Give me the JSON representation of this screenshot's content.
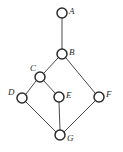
{
  "diagram": {
    "kind": "hasse-diagram",
    "background_color": "#ffffff",
    "node_stroke_color": "#2b2b2b",
    "node_fill_color": "#ffffff",
    "edge_color": "#4a4a4a",
    "label_color": "#2b2b2b",
    "node_radius": 5,
    "width": 123,
    "height": 152,
    "nodes": [
      {
        "id": "A",
        "label": "A",
        "cx": 62,
        "cy": 13,
        "label_x": 69,
        "label_y": 7
      },
      {
        "id": "B",
        "label": "B",
        "cx": 62,
        "cy": 54,
        "label_x": 69,
        "label_y": 48
      },
      {
        "id": "C",
        "label": "C",
        "cx": 40,
        "cy": 77,
        "label_x": 30,
        "label_y": 64
      },
      {
        "id": "D",
        "label": "D",
        "cx": 22,
        "cy": 98,
        "label_x": 8,
        "label_y": 88
      },
      {
        "id": "E",
        "label": "E",
        "cx": 59,
        "cy": 97,
        "label_x": 66,
        "label_y": 91
      },
      {
        "id": "F",
        "label": "F",
        "cx": 99,
        "cy": 97,
        "label_x": 106,
        "label_y": 90
      },
      {
        "id": "G",
        "label": "G",
        "cx": 60,
        "cy": 135,
        "label_x": 67,
        "label_y": 134
      }
    ],
    "edges": [
      {
        "from": "A",
        "to": "B",
        "x1": 62,
        "y1": 18,
        "x2": 62,
        "y2": 49
      },
      {
        "from": "B",
        "to": "C",
        "x1": 58,
        "y1": 58,
        "x2": 44,
        "y2": 73
      },
      {
        "from": "B",
        "to": "F",
        "x1": 66,
        "y1": 58,
        "x2": 95,
        "y2": 93
      },
      {
        "from": "C",
        "to": "D",
        "x1": 36,
        "y1": 81,
        "x2": 26,
        "y2": 94
      },
      {
        "from": "C",
        "to": "E",
        "x1": 44,
        "y1": 81,
        "x2": 55,
        "y2": 93
      },
      {
        "from": "D",
        "to": "G",
        "x1": 26,
        "y1": 102,
        "x2": 56,
        "y2": 132
      },
      {
        "from": "E",
        "to": "G",
        "x1": 59,
        "y1": 102,
        "x2": 60,
        "y2": 130
      },
      {
        "from": "F",
        "to": "G",
        "x1": 95,
        "y1": 101,
        "x2": 64,
        "y2": 132
      }
    ]
  }
}
